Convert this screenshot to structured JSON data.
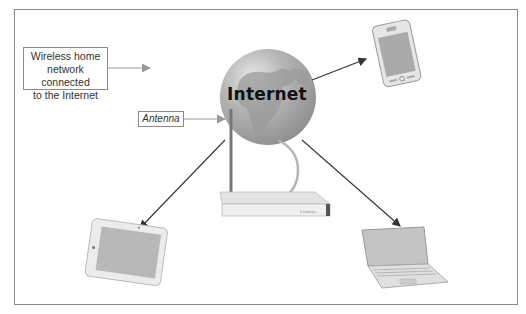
{
  "diagram": {
    "type": "network-illustration",
    "title": "Wireless home network connected to the Internet",
    "callouts": {
      "main": [
        "Wireless home",
        "network connected",
        "to the Internet"
      ],
      "antenna": "Antenna"
    },
    "center": {
      "label": "Internet",
      "icon": "globe-icon"
    },
    "hub": {
      "label": "router",
      "brand_text": "Linksys"
    },
    "devices": [
      {
        "name": "smartphone",
        "position": "top-right"
      },
      {
        "name": "tablet",
        "position": "bottom-left"
      },
      {
        "name": "laptop",
        "position": "bottom-right"
      }
    ],
    "colors": {
      "border": "#8a8a8a",
      "arrow": "#333333",
      "globe": "#a9a9a9",
      "land": "#8c8c8c"
    }
  }
}
